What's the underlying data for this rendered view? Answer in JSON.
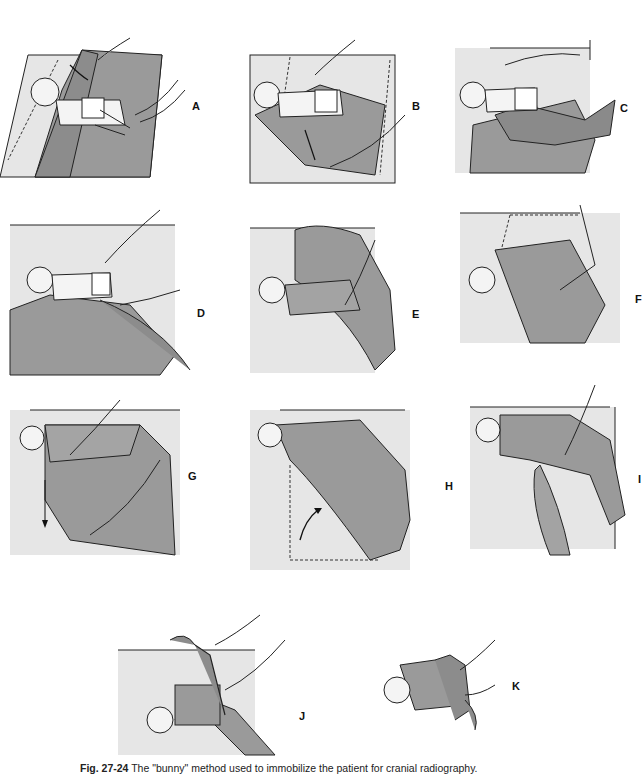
{
  "figure": {
    "number": "Fig. 27-24",
    "caption": "The \"bunny\" method used to immobilize the patient for cranial radiography.",
    "colors": {
      "sheet": "#e6e6e6",
      "blanket": "#9a9a9a",
      "line": "#222222",
      "skin": "#f4f4f4"
    },
    "panels": [
      {
        "id": "A",
        "label": "A",
        "description": "Infant placed on folded sheet; one side folded over"
      },
      {
        "id": "B",
        "label": "B",
        "description": "Arm positioned at side, sheet pulled down"
      },
      {
        "id": "C",
        "label": "C",
        "description": "Sheet wrapped across body"
      },
      {
        "id": "D",
        "label": "D",
        "description": "Infant lying on sheet with legs raised"
      },
      {
        "id": "E",
        "label": "E",
        "description": "Sheet folded over body and legs"
      },
      {
        "id": "F",
        "label": "F",
        "description": "Sheet tucked under body"
      },
      {
        "id": "G",
        "label": "G",
        "description": "Sheet pulled down toward feet"
      },
      {
        "id": "H",
        "label": "H",
        "description": "Corner folded up diagonally"
      },
      {
        "id": "I",
        "label": "I",
        "description": "Ends twisted together"
      },
      {
        "id": "J",
        "label": "J",
        "description": "Twisted ends brought up"
      },
      {
        "id": "K",
        "label": "K",
        "description": "Ends tied, forming bunny ears"
      }
    ]
  }
}
